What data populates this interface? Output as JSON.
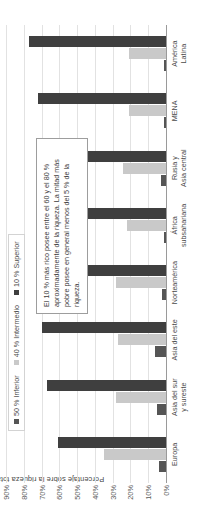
{
  "chart_data": {
    "type": "bar",
    "title": "",
    "xlabel": "",
    "ylabel": "Porcentaje sobre la riqueza total (%)",
    "ylim": [
      0,
      90
    ],
    "grid": true,
    "legend_position": "top-left",
    "categories": [
      "Europa",
      "Asia del sur y sureste",
      "Asia del este",
      "Norteamérica",
      "África subsahariana",
      "Rusia y Asia central",
      "MENA",
      "América Latina"
    ],
    "category_lines": [
      [
        "Europa"
      ],
      [
        "Asia del sur",
        "y sureste"
      ],
      [
        "Asia del este"
      ],
      [
        "Norteamérica"
      ],
      [
        "África",
        "subsahariana"
      ],
      [
        "Rusia y",
        "Asia central"
      ],
      [
        "MENA"
      ],
      [
        "América",
        "Latina"
      ]
    ],
    "series": [
      {
        "name": "50 % Inferior",
        "color": "#555555",
        "values": [
          4,
          5,
          6,
          2,
          1,
          3,
          1,
          1
        ]
      },
      {
        "name": "40 % Intermedio",
        "color": "#c9c9c9",
        "values": [
          35,
          28,
          27,
          28,
          22,
          24,
          21,
          21
        ]
      },
      {
        "name": "10 % Superior",
        "color": "#3f3f3f",
        "values": [
          61,
          67,
          70,
          71,
          65,
          68,
          72,
          77
        ]
      }
    ],
    "yticks": [
      "0%",
      "10%",
      "20%",
      "30%",
      "40%",
      "50%",
      "60%",
      "70%",
      "80%",
      "90%"
    ],
    "ytick_values": [
      0,
      10,
      20,
      30,
      40,
      50,
      60,
      70,
      80,
      90
    ],
    "annotations": [
      {
        "text": "El 10 % más rico posee entre el 60 y el 80 % aproximadamente de la riqueza. La mitad más pobre posee en general menos del 5 % de la riqueza."
      }
    ]
  },
  "legend": {
    "items": [
      {
        "label": "50 % Inferior"
      },
      {
        "label": "40 % Intermedio"
      },
      {
        "label": "10 % Superior"
      }
    ]
  }
}
